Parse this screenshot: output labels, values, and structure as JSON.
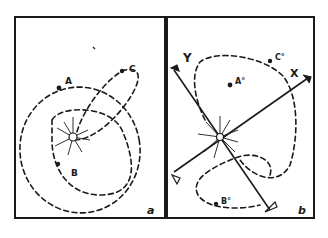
{
  "figure": {
    "panels": [
      {
        "id": "a",
        "corner_label": "a",
        "points": [
          {
            "label": "A"
          },
          {
            "label": "B"
          },
          {
            "label": "C"
          }
        ],
        "center": "sun"
      },
      {
        "id": "b",
        "corner_label": "b",
        "axes": [
          {
            "label": "X"
          },
          {
            "label": "Y"
          }
        ],
        "points": [
          {
            "label": "A°"
          },
          {
            "label": "B°"
          },
          {
            "label": "C°"
          }
        ],
        "center": "sun"
      }
    ],
    "colors": {
      "ink": "#1a1a1a",
      "paper": "#ffffff"
    }
  }
}
